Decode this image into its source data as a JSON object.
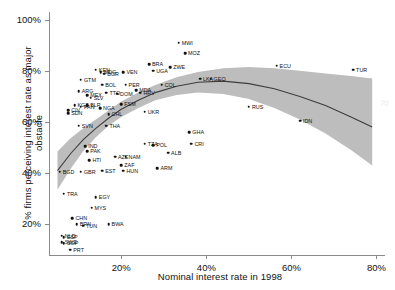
{
  "chart_data": {
    "type": "scatter",
    "title": "",
    "xlabel": "Nominal interest rate in 1998",
    "ylabel": "% firms perceiving interest rate as major obstacle",
    "xlim": [
      3,
      82
    ],
    "ylim": [
      8,
      103
    ],
    "xticks": [
      "20%",
      "40%",
      "60%",
      "80%"
    ],
    "xtick_values": [
      20,
      40,
      60,
      80
    ],
    "yticks": [
      "20%",
      "40%",
      "60%",
      "80%",
      "100%"
    ],
    "ytick_values": [
      20,
      40,
      60,
      80,
      100
    ],
    "grid": false,
    "legend": null,
    "fit": {
      "kind": "quadratic-smoother",
      "band": "95% confidence band",
      "band_color": "#b9b9b9",
      "line_color": "#3d3d3d",
      "points": [
        {
          "x": 5,
          "y": 41.0,
          "lo": 33.5,
          "hi": 48.5
        },
        {
          "x": 8,
          "y": 47.5,
          "lo": 41.5,
          "hi": 53.5
        },
        {
          "x": 11,
          "y": 53.0,
          "lo": 48.5,
          "hi": 57.5
        },
        {
          "x": 14,
          "y": 57.5,
          "lo": 54.0,
          "hi": 61.0
        },
        {
          "x": 17,
          "y": 61.5,
          "lo": 58.5,
          "hi": 64.5
        },
        {
          "x": 20,
          "y": 65.0,
          "lo": 62.0,
          "hi": 68.0
        },
        {
          "x": 24,
          "y": 68.5,
          "lo": 65.5,
          "hi": 71.5
        },
        {
          "x": 28,
          "y": 71.5,
          "lo": 68.5,
          "hi": 74.5
        },
        {
          "x": 33,
          "y": 74.0,
          "lo": 70.5,
          "hi": 77.5
        },
        {
          "x": 38,
          "y": 75.5,
          "lo": 71.5,
          "hi": 79.5
        },
        {
          "x": 44,
          "y": 76.0,
          "lo": 71.0,
          "hi": 81.0
        },
        {
          "x": 50,
          "y": 75.0,
          "lo": 69.0,
          "hi": 81.5
        },
        {
          "x": 56,
          "y": 73.0,
          "lo": 65.5,
          "hi": 81.0
        },
        {
          "x": 62,
          "y": 70.0,
          "lo": 61.0,
          "hi": 80.0
        },
        {
          "x": 68,
          "y": 66.5,
          "lo": 55.5,
          "hi": 79.0
        },
        {
          "x": 74,
          "y": 62.0,
          "lo": 49.0,
          "hi": 78.0
        },
        {
          "x": 79,
          "y": 58.0,
          "lo": 43.0,
          "hi": 77.0
        }
      ]
    },
    "points": [
      {
        "label": "MWI",
        "x": 33.5,
        "y": 91.0,
        "lp": "right"
      },
      {
        "label": "MOZ",
        "x": 35.0,
        "y": 87.0,
        "lp": "right"
      },
      {
        "label": "BRA",
        "x": 26.5,
        "y": 82.5,
        "lp": "right"
      },
      {
        "label": "UGA",
        "x": 27.5,
        "y": 80.0,
        "lp": "right"
      },
      {
        "label": "ZWE",
        "x": 31.5,
        "y": 81.5,
        "lp": "right"
      },
      {
        "label": "ECU",
        "x": 56.5,
        "y": 82.0,
        "lp": "right"
      },
      {
        "label": "TUR",
        "x": 74.5,
        "y": 80.5,
        "lp": "right"
      },
      {
        "label": "KEN",
        "x": 14.0,
        "y": 80.5,
        "lp": "right"
      },
      {
        "label": "MDG",
        "x": 15.2,
        "y": 79.5,
        "lp": "right"
      },
      {
        "label": "BGR",
        "x": 16.0,
        "y": 78.8,
        "lp": "right"
      },
      {
        "label": "VEN",
        "x": 20.5,
        "y": 79.5,
        "lp": "right"
      },
      {
        "label": "GTM",
        "x": 10.5,
        "y": 76.5,
        "lp": "right"
      },
      {
        "label": "BOL",
        "x": 15.5,
        "y": 74.5,
        "lp": "right"
      },
      {
        "label": "PER",
        "x": 21.0,
        "y": 74.5,
        "lp": "right"
      },
      {
        "label": "ARG",
        "x": 10.0,
        "y": 72.0,
        "lp": "right"
      },
      {
        "label": "TTO",
        "x": 16.5,
        "y": 71.5,
        "lp": "right"
      },
      {
        "label": "DOM",
        "x": 19.0,
        "y": 71.0,
        "lp": "right"
      },
      {
        "label": "MEX",
        "x": 12.0,
        "y": 70.5,
        "lp": "right"
      },
      {
        "label": "SLV",
        "x": 12.8,
        "y": 69.5,
        "lp": "right"
      },
      {
        "label": "COL",
        "x": 29.5,
        "y": 74.5,
        "lp": "right"
      },
      {
        "label": "LKA",
        "x": 38.5,
        "y": 77.0,
        "lp": "right"
      },
      {
        "label": "GEO",
        "x": 41.0,
        "y": 77.0,
        "lp": "right"
      },
      {
        "label": "MDA",
        "x": 23.5,
        "y": 72.5,
        "lp": "right"
      },
      {
        "label": "HRV",
        "x": 24.5,
        "y": 71.5,
        "lp": "right"
      },
      {
        "label": "KGZ",
        "x": 9.0,
        "y": 66.5,
        "lp": "right"
      },
      {
        "label": "PAN",
        "x": 10.5,
        "y": 66.0,
        "lp": "right"
      },
      {
        "label": "BLR",
        "x": 12.0,
        "y": 66.5,
        "lp": "right"
      },
      {
        "label": "NGA",
        "x": 15.0,
        "y": 65.5,
        "lp": "right"
      },
      {
        "label": "FSM",
        "x": 20.0,
        "y": 67.0,
        "lp": "right"
      },
      {
        "label": "SDN",
        "x": 7.5,
        "y": 63.5,
        "lp": "right"
      },
      {
        "label": "CIV",
        "x": 7.5,
        "y": 64.5,
        "lp": "right"
      },
      {
        "label": "CHL",
        "x": 17.0,
        "y": 63.0,
        "lp": "right"
      },
      {
        "label": "UKR",
        "x": 25.5,
        "y": 64.0,
        "lp": "right"
      },
      {
        "label": "RUS",
        "x": 50.0,
        "y": 66.0,
        "lp": "right"
      },
      {
        "label": "IDN",
        "x": 62.0,
        "y": 60.5,
        "lp": "right"
      },
      {
        "label": "SVN",
        "x": 10.0,
        "y": 58.5,
        "lp": "right"
      },
      {
        "label": "THA",
        "x": 16.5,
        "y": 58.5,
        "lp": "right"
      },
      {
        "label": "GHA",
        "x": 36.0,
        "y": 56.0,
        "lp": "right"
      },
      {
        "label": "CRI",
        "x": 36.5,
        "y": 51.5,
        "lp": "right"
      },
      {
        "label": "TZA",
        "x": 25.5,
        "y": 51.5,
        "lp": "right"
      },
      {
        "label": "POL",
        "x": 27.5,
        "y": 51.0,
        "lp": "right"
      },
      {
        "label": "ALB",
        "x": 31.0,
        "y": 48.0,
        "lp": "right"
      },
      {
        "label": "IND",
        "x": 11.5,
        "y": 50.5,
        "lp": "right"
      },
      {
        "label": "PAK",
        "x": 12.0,
        "y": 48.5,
        "lp": "right"
      },
      {
        "label": "AZE",
        "x": 18.5,
        "y": 46.5,
        "lp": "right"
      },
      {
        "label": "NAM",
        "x": 21.0,
        "y": 46.5,
        "lp": "right"
      },
      {
        "label": "HTI",
        "x": 12.5,
        "y": 45.0,
        "lp": "right"
      },
      {
        "label": "ZAF",
        "x": 20.0,
        "y": 43.0,
        "lp": "right"
      },
      {
        "label": "EST",
        "x": 15.5,
        "y": 41.0,
        "lp": "right"
      },
      {
        "label": "HUN",
        "x": 20.5,
        "y": 41.0,
        "lp": "right"
      },
      {
        "label": "GBR",
        "x": 10.5,
        "y": 40.5,
        "lp": "right"
      },
      {
        "label": "BGD",
        "x": 5.5,
        "y": 40.5,
        "lp": "right"
      },
      {
        "label": "ARM",
        "x": 28.5,
        "y": 42.0,
        "lp": "right"
      },
      {
        "label": "TRA",
        "x": 6.5,
        "y": 32.0,
        "lp": "right"
      },
      {
        "label": "EGY",
        "x": 14.0,
        "y": 30.5,
        "lp": "right"
      },
      {
        "label": "MYS",
        "x": 13.0,
        "y": 26.5,
        "lp": "right"
      },
      {
        "label": "CHN",
        "x": 8.5,
        "y": 22.5,
        "lp": "right"
      },
      {
        "label": "BRN",
        "x": 9.5,
        "y": 20.0,
        "lp": "right"
      },
      {
        "label": "TUN",
        "x": 11.0,
        "y": 19.5,
        "lp": "right"
      },
      {
        "label": "BWA",
        "x": 17.0,
        "y": 20.0,
        "lp": "right"
      },
      {
        "label": "NLD",
        "x": 6.0,
        "y": 15.5,
        "lp": "right"
      },
      {
        "label": "ESP",
        "x": 6.5,
        "y": 15.0,
        "lp": "right"
      },
      {
        "label": "SWE",
        "x": 6.0,
        "y": 13.0,
        "lp": "right"
      },
      {
        "label": "SGP",
        "x": 6.5,
        "y": 12.5,
        "lp": "right"
      },
      {
        "label": "PRT",
        "x": 8.0,
        "y": 10.0,
        "lp": "right"
      }
    ]
  },
  "watermark": {
    "text": "≈"
  }
}
